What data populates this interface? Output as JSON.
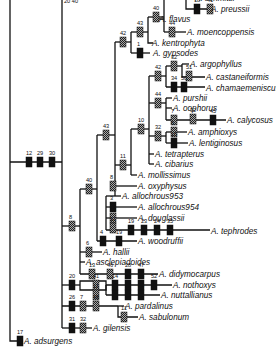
{
  "diagram": {
    "type": "phylogenetic-tree",
    "taxa": [
      {
        "id": "t_schmitt",
        "label": "A. schmittii",
        "x": 194,
        "y": -2
      },
      {
        "id": "t_preussii",
        "label": "A. preussii",
        "x": 210,
        "y": 9
      },
      {
        "id": "t_flavus",
        "label": "A. flavus",
        "x": 158,
        "y": 19
      },
      {
        "id": "t_moenco",
        "label": "A. moencoppensis",
        "x": 186,
        "y": 32
      },
      {
        "id": "t_kentro",
        "label": "A. kentrophyta",
        "x": 151,
        "y": 43
      },
      {
        "id": "t_gypsodes",
        "label": "A. gypsodes",
        "x": 152,
        "y": 53
      },
      {
        "id": "t_argoph",
        "label": "A. argophyllus",
        "x": 189,
        "y": 64
      },
      {
        "id": "t_castan",
        "label": "A. castaneiformis",
        "x": 205,
        "y": 77
      },
      {
        "id": "t_chamae",
        "label": "A. chamaemeniscus",
        "x": 205,
        "y": 88
      },
      {
        "id": "t_purshii",
        "label": "A. purshii",
        "x": 172,
        "y": 98
      },
      {
        "id": "t_oophorus",
        "label": "A. oophorus",
        "x": 172,
        "y": 108
      },
      {
        "id": "t_calycosus",
        "label": "A. calycosus",
        "x": 226,
        "y": 120
      },
      {
        "id": "t_amphioxys",
        "label": "A. amphioxys",
        "x": 187,
        "y": 132
      },
      {
        "id": "t_lentig",
        "label": "A. lentiginosus",
        "x": 188,
        "y": 143
      },
      {
        "id": "t_tetrap",
        "label": "A. tetrapterus",
        "x": 154,
        "y": 154
      },
      {
        "id": "t_cibarius",
        "label": "A. cibarius",
        "x": 154,
        "y": 164
      },
      {
        "id": "t_mollis",
        "label": "A. mollissimus",
        "x": 137,
        "y": 175
      },
      {
        "id": "t_oxyphysus",
        "label": "A. oxyphysus",
        "x": 137,
        "y": 186
      },
      {
        "id": "t_allo953",
        "label": "A. allochrous953",
        "x": 121,
        "y": 196
      },
      {
        "id": "t_allo954",
        "label": "A. allochrous954",
        "x": 137,
        "y": 207
      },
      {
        "id": "t_douglassii",
        "label": "A. douglassii",
        "x": 137,
        "y": 218
      },
      {
        "id": "t_tephrodes",
        "label": "A. tephrodes",
        "x": 210,
        "y": 231
      },
      {
        "id": "t_woodruffii",
        "label": "A. woodruffii",
        "x": 137,
        "y": 241
      },
      {
        "id": "t_hallii",
        "label": "A. hallii",
        "x": 102,
        "y": 252
      },
      {
        "id": "t_asclep",
        "label": "A. asclepiadoides",
        "x": 85,
        "y": 262
      },
      {
        "id": "t_didymo",
        "label": "A. didymocarpus",
        "x": 158,
        "y": 274
      },
      {
        "id": "t_nothoxys",
        "label": "A. nothoxys",
        "x": 172,
        "y": 285
      },
      {
        "id": "t_nuttall",
        "label": "A. nuttallianus",
        "x": 160,
        "y": 295
      },
      {
        "id": "t_pardal",
        "label": "A. pardalinus",
        "x": 124,
        "y": 306
      },
      {
        "id": "t_sabulon",
        "label": "A. sabulonum",
        "x": 138,
        "y": 317
      },
      {
        "id": "t_gilensis",
        "label": "A. gilensis",
        "x": 92,
        "y": 328
      },
      {
        "id": "t_adsurgens",
        "label": "A. adsurgens",
        "x": 23,
        "y": 341
      }
    ],
    "characters": [
      {
        "n": "12",
        "x": 29,
        "y": 162,
        "kind": "solid"
      },
      {
        "n": "29",
        "x": 40,
        "y": 162,
        "kind": "solid"
      },
      {
        "n": "30",
        "x": 52,
        "y": 162,
        "kind": "solid"
      },
      {
        "n": "8",
        "x": 72,
        "y": 226,
        "kind": "hatched"
      },
      {
        "n": "40",
        "x": 89,
        "y": 189,
        "kind": "hatched"
      },
      {
        "n": "43",
        "x": 106,
        "y": 135,
        "kind": "hatched"
      },
      {
        "n": "11",
        "x": 123,
        "y": 165,
        "kind": "hatched"
      },
      {
        "n": "10",
        "x": 141,
        "y": 129,
        "kind": "hatched"
      },
      {
        "n": "42",
        "x": 123,
        "y": 42,
        "kind": "hatched"
      },
      {
        "n": "43",
        "x": 140,
        "y": 32,
        "kind": "hatched"
      },
      {
        "n": "1",
        "x": 140,
        "y": 53,
        "kind": "solid"
      },
      {
        "n": "40",
        "x": 156,
        "y": 17,
        "kind": "hatched"
      },
      {
        "n": "44",
        "x": 172,
        "y": 32,
        "kind": "hatched"
      },
      {
        "n": "18",
        "x": 197,
        "y": 9,
        "kind": "solid"
      },
      {
        "n": "41",
        "x": 210,
        "y": 9,
        "kind": "hatched"
      },
      {
        "n": "42",
        "x": 158,
        "y": 76,
        "kind": "hatched"
      },
      {
        "n": "32",
        "x": 174,
        "y": 66,
        "kind": "hatched"
      },
      {
        "n": "51",
        "x": 189,
        "y": 76,
        "kind": "hatched"
      },
      {
        "n": "34",
        "x": 174,
        "y": 87,
        "kind": "solid"
      },
      {
        "n": "50",
        "x": 184,
        "y": 87,
        "kind": "solid"
      },
      {
        "n": "44",
        "x": 158,
        "y": 103,
        "kind": "hatched"
      },
      {
        "n": "7",
        "x": 174,
        "y": 120,
        "kind": "hatched"
      },
      {
        "n": "32",
        "x": 193,
        "y": 119,
        "kind": "hatched"
      },
      {
        "n": "45",
        "x": 213,
        "y": 120,
        "kind": "solid"
      },
      {
        "n": "32",
        "x": 158,
        "y": 136,
        "kind": "hatched"
      },
      {
        "n": "6",
        "x": 174,
        "y": 132,
        "kind": "hatched"
      },
      {
        "n": "15",
        "x": 174,
        "y": 143,
        "kind": "solid"
      },
      {
        "n": "8",
        "x": 113,
        "y": 186,
        "kind": "hatched"
      },
      {
        "n": "3",
        "x": 113,
        "y": 207,
        "kind": "solid"
      },
      {
        "n": "13",
        "x": 113,
        "y": 218,
        "kind": "hatched"
      },
      {
        "n": "51",
        "x": 113,
        "y": 228,
        "kind": "hatched"
      },
      {
        "n": "19",
        "x": 131,
        "y": 230,
        "kind": "solid"
      },
      {
        "n": "23",
        "x": 144,
        "y": 230,
        "kind": "solid"
      },
      {
        "n": "24",
        "x": 157,
        "y": 230,
        "kind": "solid"
      },
      {
        "n": "35",
        "x": 170,
        "y": 230,
        "kind": "solid"
      },
      {
        "n": "4",
        "x": 103,
        "y": 241,
        "kind": "solid"
      },
      {
        "n": "19",
        "x": 119,
        "y": 241,
        "kind": "solid"
      },
      {
        "n": "6",
        "x": 89,
        "y": 252,
        "kind": "hatched"
      },
      {
        "n": "13",
        "x": 92,
        "y": 274,
        "kind": "hatched"
      },
      {
        "n": "46",
        "x": 110,
        "y": 274,
        "kind": "hatched"
      },
      {
        "n": "28",
        "x": 128,
        "y": 274,
        "kind": "solid"
      },
      {
        "n": "47",
        "x": 141,
        "y": 274,
        "kind": "solid"
      },
      {
        "n": "20",
        "x": 72,
        "y": 285,
        "kind": "solid"
      },
      {
        "n": "41",
        "x": 96,
        "y": 285,
        "kind": "hatched"
      },
      {
        "n": "14",
        "x": 115,
        "y": 285,
        "kind": "solid"
      },
      {
        "n": "22",
        "x": 128,
        "y": 285,
        "kind": "solid"
      },
      {
        "n": "36",
        "x": 141,
        "y": 285,
        "kind": "solid"
      },
      {
        "n": "52",
        "x": 154,
        "y": 285,
        "kind": "solid"
      },
      {
        "n": "11",
        "x": 96,
        "y": 295,
        "kind": "hatched"
      },
      {
        "n": "2",
        "x": 115,
        "y": 295,
        "kind": "solid"
      },
      {
        "n": "9",
        "x": 128,
        "y": 295,
        "kind": "solid"
      },
      {
        "n": "49",
        "x": 141,
        "y": 295,
        "kind": "solid"
      },
      {
        "n": "26",
        "x": 72,
        "y": 306,
        "kind": "solid"
      },
      {
        "n": "7",
        "x": 83,
        "y": 306,
        "kind": "hatched"
      },
      {
        "n": "48",
        "x": 96,
        "y": 306,
        "kind": "hatched"
      },
      {
        "n": "11",
        "x": 124,
        "y": 317,
        "kind": "hatched"
      },
      {
        "n": "31",
        "x": 72,
        "y": 328,
        "kind": "solid"
      },
      {
        "n": "32",
        "x": 83,
        "y": 328,
        "kind": "hatched"
      },
      {
        "n": "17",
        "x": 20,
        "y": 341,
        "kind": "solid"
      }
    ],
    "top_partial_label": "20 40"
  }
}
